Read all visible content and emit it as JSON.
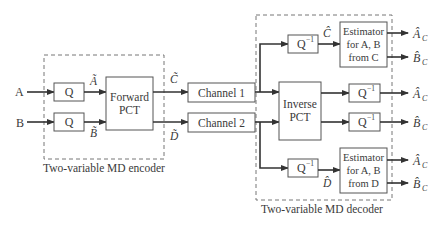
{
  "inputs": {
    "a": "A",
    "b": "B"
  },
  "encoder": {
    "label": "Two-variable MD encoder",
    "q_label": "Q",
    "q_a_out": "Ã",
    "q_b_out": "B̃",
    "forward_pct": [
      "Forward",
      "PCT"
    ],
    "out_c": "C̃",
    "out_d": "D̃"
  },
  "channels": {
    "ch1": "Channel 1",
    "ch2": "Channel 2"
  },
  "decoder": {
    "label": "Two-variable MD decoder",
    "qinv_base": "Q",
    "qinv_sup": "−1",
    "c_hat": "Ĉ",
    "d_hat": "D̂",
    "inverse_pct": [
      "Inverse",
      "PCT"
    ],
    "estimator_c": [
      "Estimator",
      "for A, B",
      "from C"
    ],
    "estimator_d": [
      "Estimator",
      "for A, B",
      "from D"
    ]
  },
  "outputs": {
    "a_base": "Â",
    "b_base": "B̂",
    "sub": "C"
  }
}
